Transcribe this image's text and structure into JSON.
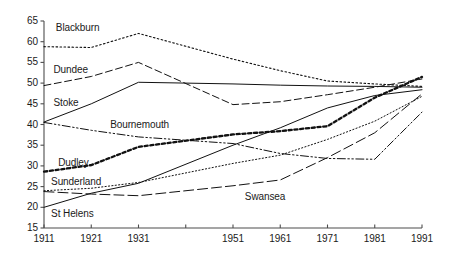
{
  "chart_data": {
    "type": "line",
    "title": "",
    "xlabel": "",
    "ylabel": "",
    "x": [
      1911,
      1921,
      1931,
      1951,
      1961,
      1971,
      1981,
      1991
    ],
    "x_tick_labels": [
      "1911",
      "1921",
      "1931",
      "1951",
      "1961",
      "1971",
      "1981",
      "1991"
    ],
    "x_minor_tick_years": [
      1941
    ],
    "y_tick_labels": [
      "15",
      "20",
      "25",
      "30",
      "35",
      "40",
      "45",
      "50",
      "55",
      "60",
      "65"
    ],
    "y_ticks": [
      15,
      20,
      25,
      30,
      35,
      40,
      45,
      50,
      55,
      60,
      65
    ],
    "xlim": [
      1911,
      1991
    ],
    "ylim": [
      15,
      65
    ],
    "grid": false,
    "legend": "inline-labels",
    "series": [
      {
        "name": "Blackburn",
        "style": "dotted",
        "label_x": 1913.5,
        "label_y": 63.2,
        "values": [
          58.8,
          58.6,
          62.0,
          55.8,
          53.0,
          50.5,
          49.8,
          49.2
        ]
      },
      {
        "name": "Dundee",
        "style": "dashed",
        "label_x": 1913.0,
        "label_y": 53.2,
        "values": [
          49.4,
          51.6,
          55.0,
          44.8,
          45.5,
          47.2,
          49.0,
          51.0
        ]
      },
      {
        "name": "Stoke",
        "style": "solid",
        "label_x": 1913.0,
        "label_y": 45.3,
        "values": [
          40.6,
          45.0,
          50.2,
          49.8,
          49.5,
          49.3,
          49.2,
          49.0
        ]
      },
      {
        "name": "Bournemouth",
        "style": "dash-dot-dot",
        "label_x": 1925.0,
        "label_y": 39.8,
        "values": [
          40.5,
          38.6,
          37.0,
          35.4,
          33.0,
          31.8,
          31.6,
          43.0
        ]
      },
      {
        "name": "Dudley",
        "style": "thick-dotted",
        "label_x": 1914.0,
        "label_y": 30.6,
        "values": [
          28.6,
          30.2,
          34.6,
          37.6,
          38.4,
          39.6,
          46.5,
          51.5
        ]
      },
      {
        "name": "Sunderland",
        "style": "fine-dotted",
        "label_x": 1912.5,
        "label_y": 26.0,
        "values": [
          24.0,
          24.6,
          26.0,
          30.6,
          32.6,
          36.4,
          40.8,
          46.8
        ]
      },
      {
        "name": "St Helens",
        "style": "solid",
        "label_x": 1912.5,
        "label_y": 18.5,
        "values": [
          20.0,
          23.4,
          25.8,
          35.0,
          39.2,
          44.0,
          47.0,
          48.4
        ]
      },
      {
        "name": "Swansea",
        "style": "long-dashed",
        "label_x": 1953.5,
        "label_y": 22.4,
        "values": [
          23.8,
          23.2,
          22.8,
          25.2,
          26.6,
          32.0,
          38.0,
          47.4
        ]
      }
    ]
  },
  "axes": {
    "axis_color": "#4d4d4d"
  }
}
